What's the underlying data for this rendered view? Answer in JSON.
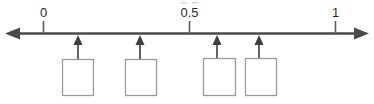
{
  "diagram": {
    "type": "number-line",
    "orientation": "horizontal",
    "colors": {
      "axis": "#4a4a4a",
      "tick": "#5a5a5a",
      "label_text": "#2b2b2b",
      "box_border": "#9a9a9a",
      "box_fill": "#ffffff",
      "pointer": "#3d3d3d",
      "background": "#ffffff"
    },
    "axis": {
      "label": "",
      "left_arrow": true,
      "right_arrow": true,
      "line_y": 33,
      "x_start": 6,
      "x_end": 368,
      "range_visible_min": 0,
      "range_visible_max": 1
    },
    "ticks": [
      {
        "label": "0",
        "value": 0,
        "x": 43
      },
      {
        "label": "0.5",
        "value": 0.5,
        "x": 189
      },
      {
        "label": "1",
        "value": 1,
        "x": 335
      }
    ],
    "answer_boxes": [
      {
        "id": "box-1",
        "label": "",
        "placeholder": "",
        "x": 62,
        "y": 59,
        "width": 31,
        "height": 37,
        "pointer_x": 78
      },
      {
        "id": "box-2",
        "label": "",
        "placeholder": "",
        "x": 125,
        "y": 59,
        "width": 31,
        "height": 37,
        "pointer_x": 140
      },
      {
        "id": "box-3",
        "label": "",
        "placeholder": "",
        "x": 203,
        "y": 58,
        "width": 32,
        "height": 38,
        "pointer_x": 217
      },
      {
        "id": "box-4",
        "label": "",
        "placeholder": "",
        "x": 245,
        "y": 58,
        "width": 31,
        "height": 38,
        "pointer_x": 259
      }
    ]
  }
}
